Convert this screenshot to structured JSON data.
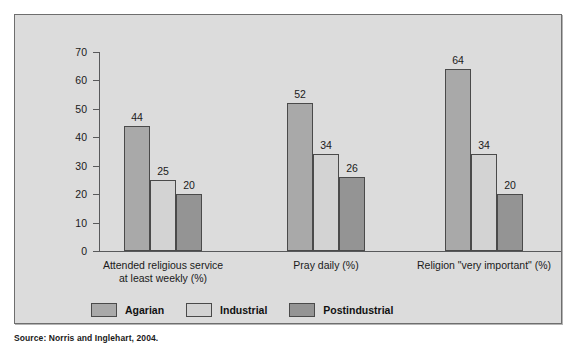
{
  "chart_data": {
    "type": "bar",
    "title": "",
    "subtitle": "",
    "xlabel": "",
    "ylabel": "",
    "ylim": [
      0,
      70
    ],
    "yticks": [
      0,
      10,
      20,
      30,
      40,
      50,
      60,
      70
    ],
    "grid": false,
    "legend_position": "bottom-left",
    "categories": [
      "Attended religious service at least weekly (%)",
      "Pray daily (%)",
      "Religion \"very important\" (%)"
    ],
    "category_lines": [
      [
        "Attended religious service",
        "at least weekly (%)"
      ],
      [
        "Pray daily (%)"
      ],
      [
        "Religion \"very important\" (%)"
      ]
    ],
    "series": [
      {
        "name": "Agarian",
        "color": "#a9a9a9",
        "values": [
          44,
          52,
          64
        ]
      },
      {
        "name": "Industrial",
        "color": "#d3d3d3",
        "values": [
          25,
          34,
          34
        ]
      },
      {
        "name": "Postindustrial",
        "color": "#949494",
        "values": [
          20,
          26,
          20
        ]
      }
    ]
  },
  "legend": {
    "items": [
      {
        "label": "Agarian"
      },
      {
        "label": "Industrial"
      },
      {
        "label": "Postindustrial"
      }
    ]
  },
  "axis": {
    "y_ticks": [
      "70",
      "60",
      "50",
      "40",
      "30",
      "20",
      "10",
      "0"
    ]
  },
  "bar_labels": {
    "g0": [
      "44",
      "25",
      "20"
    ],
    "g1": [
      "52",
      "34",
      "26"
    ],
    "g2": [
      "64",
      "34",
      "20"
    ]
  },
  "source": {
    "text": "Source: Norris and Inglehart, 2004."
  },
  "colors": {
    "figure_background": "#dcdcdc",
    "figure_border": "#6e6e6e",
    "axis": "#58595b",
    "bar_outline": "#4a4a4a",
    "agarian": "#a9a9a9",
    "industrial": "#d3d3d3",
    "postindustrial": "#949494",
    "text": "#1a1a1a"
  }
}
